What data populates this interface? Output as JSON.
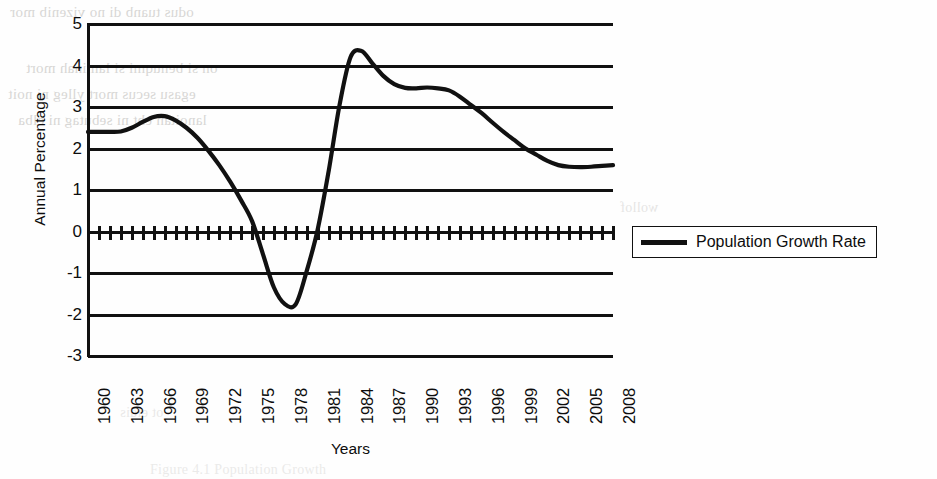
{
  "chart_data": {
    "type": "line",
    "title": "",
    "xlabel": "Years",
    "ylabel": "Annual Percentage",
    "ylim": [
      -3,
      5
    ],
    "xlim": [
      1960,
      2008
    ],
    "grid": "horizontal-gridlines-at-every-integer",
    "legend_position": "right-outside",
    "y_ticks": [
      "5",
      "4",
      "3",
      "2",
      "1",
      "0",
      "-1",
      "-2",
      "-3"
    ],
    "x_ticks": [
      "1960",
      "1963",
      "1966",
      "1969",
      "1972",
      "1975",
      "1978",
      "1981",
      "1984",
      "1987",
      "1990",
      "1993",
      "1996",
      "1999",
      "2002",
      "2005",
      "2008"
    ],
    "series": [
      {
        "name": "Population Growth Rate",
        "color": "#111111",
        "x": [
          1960,
          1961,
          1962,
          1963,
          1964,
          1965,
          1966,
          1967,
          1968,
          1969,
          1970,
          1971,
          1972,
          1973,
          1974,
          1975,
          1976,
          1977,
          1978,
          1979,
          1980,
          1981,
          1982,
          1983,
          1984,
          1985,
          1986,
          1987,
          1988,
          1989,
          1990,
          1991,
          1992,
          1993,
          1994,
          1995,
          1996,
          1997,
          1998,
          1999,
          2000,
          2001,
          2002,
          2003,
          2004,
          2005,
          2006,
          2007,
          2008
        ],
        "values": [
          2.4,
          2.4,
          2.4,
          2.41,
          2.5,
          2.64,
          2.76,
          2.78,
          2.68,
          2.5,
          2.26,
          1.95,
          1.6,
          1.2,
          0.75,
          0.25,
          -0.55,
          -1.35,
          -1.75,
          -1.75,
          -0.95,
          0.05,
          1.45,
          3.05,
          4.2,
          4.35,
          4.05,
          3.75,
          3.55,
          3.46,
          3.45,
          3.47,
          3.45,
          3.4,
          3.25,
          3.05,
          2.85,
          2.62,
          2.4,
          2.2,
          2.0,
          1.85,
          1.7,
          1.6,
          1.56,
          1.55,
          1.56,
          1.58,
          1.6
        ]
      }
    ]
  },
  "legend": {
    "entries": [
      {
        "label": "Population Growth Rate",
        "color": "#111111"
      }
    ]
  },
  "background_ghost_text": {
    "lines": [
      "odus tuanb di no vizenib mor",
      "on si benuqmi si laminah mort",
      "egasu secus mort ylleg ni noit",
      "lanoitan eht ni sebutag ni elba",
      "wollof",
      "ot eldis",
      "Figure 4.1  Population Growth"
    ]
  }
}
